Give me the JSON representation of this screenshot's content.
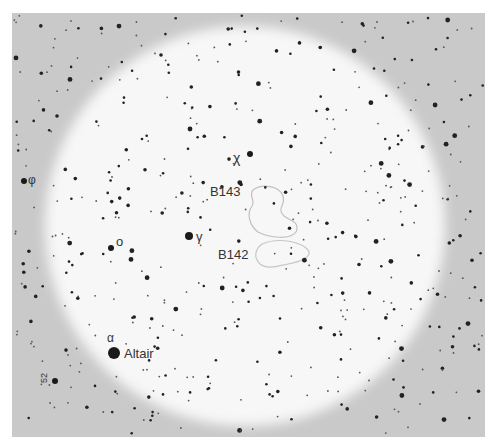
{
  "map": {
    "frame": {
      "x": 12,
      "y": 13,
      "width": 473,
      "height": 424,
      "fill": "#c9c9c9"
    },
    "field_circle": {
      "cx": 245,
      "cy": 226,
      "r": 200,
      "fill": "#f7f7f7"
    },
    "labels": {
      "chi": "χ",
      "b143": "B143",
      "b142": "B142",
      "gamma": "γ",
      "omicron": "o",
      "phi": "φ",
      "alpha": "α",
      "altair": "Altair",
      "star_52": "52"
    },
    "named_stars": [
      {
        "name": "Altair",
        "x": 114,
        "y": 353,
        "r": 6
      },
      {
        "name": "gamma",
        "x": 189,
        "y": 236,
        "r": 4
      },
      {
        "name": "omicron",
        "x": 111,
        "y": 248,
        "r": 3
      },
      {
        "name": "chi",
        "x": 250,
        "y": 154,
        "r": 3
      },
      {
        "name": "phi",
        "x": 24,
        "y": 181,
        "r": 3
      },
      {
        "name": "52",
        "x": 55,
        "y": 381,
        "r": 3
      }
    ],
    "dark_nebulae": [
      {
        "id": "B143",
        "x": 270,
        "y": 210
      },
      {
        "id": "B142",
        "x": 290,
        "y": 250
      }
    ]
  }
}
